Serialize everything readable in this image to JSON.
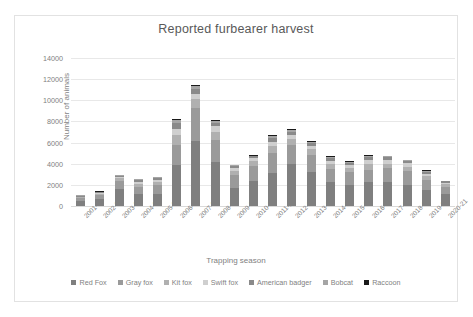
{
  "chart_data": {
    "type": "bar",
    "title": "Reported furbearer harvest",
    "xlabel": "Trapping season",
    "ylabel": "Number of animals",
    "ylim": [
      0,
      14000
    ],
    "ytick_step": 2000,
    "yticks": [
      "14000",
      "12000",
      "10000",
      "8000",
      "6000",
      "4000",
      "2000",
      "0"
    ],
    "grid": true,
    "stacked": true,
    "legend_position": "bottom",
    "categories": [
      "2001-02",
      "2002-3",
      "2003-04",
      "2004-05",
      "2005-06",
      "2006-07",
      "2007-08",
      "2008-09",
      "2009-10",
      "2010-11",
      "2011-12",
      "2012-13",
      "2013-14",
      "2014-15",
      "2015-16",
      "2016-17",
      "2017-18",
      "2018-19",
      "2019-20",
      "2020-21"
    ],
    "series": [
      {
        "name": "Red Fox",
        "color": "#7f7f7f",
        "values": [
          430,
          620,
          1620,
          1120,
          1180,
          3900,
          6150,
          4150,
          1700,
          2400,
          3150,
          4000,
          3250,
          2300,
          1950,
          2250,
          2300,
          2000,
          1550,
          1100
        ]
      },
      {
        "name": "Gray fox",
        "color": "#9a9a9a",
        "values": [
          300,
          380,
          750,
          700,
          800,
          1900,
          3100,
          2100,
          1200,
          1350,
          1850,
          1750,
          1600,
          1200,
          1250,
          1200,
          1250,
          1300,
          900,
          700
        ]
      },
      {
        "name": "Kit fox",
        "color": "#b0b0b0",
        "values": [
          110,
          150,
          250,
          300,
          330,
          900,
          900,
          800,
          450,
          500,
          700,
          600,
          550,
          450,
          400,
          500,
          450,
          400,
          350,
          250
        ]
      },
      {
        "name": "Swift fox",
        "color": "#cfcfcf",
        "values": [
          60,
          80,
          130,
          150,
          130,
          600,
          450,
          500,
          250,
          250,
          400,
          350,
          300,
          350,
          300,
          400,
          350,
          350,
          250,
          150
        ]
      },
      {
        "name": "American badger",
        "color": "#8a8a8a",
        "values": [
          80,
          100,
          120,
          170,
          200,
          550,
          450,
          300,
          180,
          200,
          350,
          300,
          250,
          250,
          200,
          250,
          250,
          200,
          200,
          130
        ]
      },
      {
        "name": "Bobcat",
        "color": "#a5a5a5",
        "values": [
          40,
          40,
          50,
          80,
          80,
          300,
          300,
          150,
          80,
          70,
          150,
          200,
          120,
          100,
          100,
          120,
          100,
          100,
          100,
          40
        ]
      },
      {
        "name": "Raccoon",
        "color": "#1a1a1a",
        "values": [
          30,
          30,
          30,
          30,
          30,
          50,
          150,
          100,
          40,
          30,
          100,
          100,
          80,
          50,
          50,
          80,
          50,
          50,
          50,
          30
        ]
      }
    ],
    "totals": [
      1050,
      1400,
      2950,
      2550,
      2750,
      8200,
      11500,
      8100,
      3900,
      4800,
      6700,
      7300,
      6150,
      4700,
      4250,
      4800,
      4750,
      4400,
      3400,
      2400
    ]
  }
}
